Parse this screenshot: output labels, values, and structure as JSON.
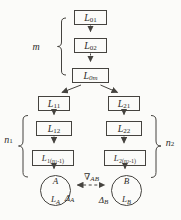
{
  "colors": {
    "background": "#fbfbf9",
    "line": "#45433f",
    "ink": "#2e2c29"
  },
  "side_labels": {
    "m": "m",
    "n1": {
      "main": "n",
      "sub": "1"
    },
    "n2": {
      "main": "n",
      "sub": "2"
    }
  },
  "boxes": {
    "l01": {
      "main": "L",
      "sub": "01"
    },
    "l02": {
      "main": "L",
      "sub": "02"
    },
    "l0m": {
      "main": "L",
      "sub": "0m"
    },
    "l11": {
      "main": "L",
      "sub": "11"
    },
    "l21": {
      "main": "L",
      "sub": "21"
    },
    "l12": {
      "main": "L",
      "sub": "12"
    },
    "l22": {
      "main": "L",
      "sub": "22"
    },
    "l1n": {
      "main": "L",
      "sub_open": "1(",
      "sub_var": "n",
      "sub_var_sub": "1",
      "sub_close": "-1)"
    },
    "l2n": {
      "main": "L",
      "sub_open": "2(",
      "sub_var": "n",
      "sub_var_sub": "2",
      "sub_close": "-1)"
    }
  },
  "circles": {
    "a": {
      "name": "A",
      "line2_main": "L",
      "line2_sub": "A"
    },
    "b": {
      "name": "B",
      "line2_main": "L",
      "line2_sub": "B"
    }
  },
  "annotations": {
    "gradient": {
      "main": "∇",
      "sub": "AB"
    },
    "delta_a": {
      "main": "Δ",
      "sub": "A"
    },
    "delta_b": {
      "main": "Δ",
      "sub": "B"
    }
  }
}
